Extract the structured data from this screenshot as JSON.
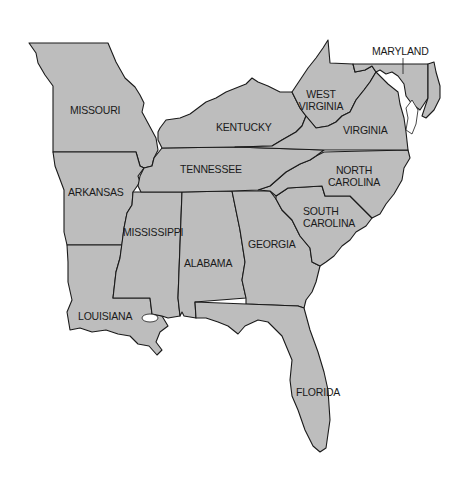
{
  "map": {
    "title": "",
    "region": "Southeastern United States",
    "fill_color": "#bdbdbd",
    "stroke_color": "#1a1a1a",
    "background_color": "#ffffff",
    "states": [
      {
        "id": "missouri",
        "label": "MISSOURI"
      },
      {
        "id": "kentucky",
        "label": "KENTUCKY"
      },
      {
        "id": "west-virginia",
        "label_line1": "WEST",
        "label_line2": "VIRGINIA"
      },
      {
        "id": "maryland",
        "label": "MARYLAND"
      },
      {
        "id": "virginia",
        "label": "VIRGINIA"
      },
      {
        "id": "tennessee",
        "label": "TENNESSEE"
      },
      {
        "id": "north-carolina",
        "label_line1": "NORTH",
        "label_line2": "CAROLINA"
      },
      {
        "id": "arkansas",
        "label": "ARKANSAS"
      },
      {
        "id": "south-carolina",
        "label_line1": "SOUTH",
        "label_line2": "CAROLINA"
      },
      {
        "id": "mississippi",
        "label": "MISSISSIPPI"
      },
      {
        "id": "alabama",
        "label": "ALABAMA"
      },
      {
        "id": "georgia",
        "label": "GEORGIA"
      },
      {
        "id": "louisiana",
        "label": "LOUISIANA"
      },
      {
        "id": "florida",
        "label": "FLORIDA"
      }
    ]
  }
}
